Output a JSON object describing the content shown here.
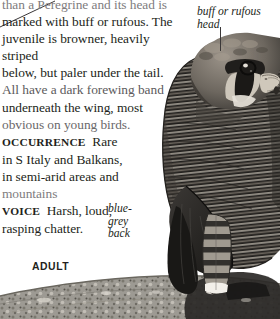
{
  "page": {
    "background_color": "#ffffff",
    "width": 280,
    "height": 319
  },
  "description": {
    "lines": [
      "than a Peregrine and its head is",
      "marked with buff or rufous. The",
      "juvenile is browner, heavily striped",
      "below, but paler under the tail.",
      "All have a dark forewing band",
      "underneath the wing, most",
      "obvious on young birds."
    ],
    "line1": "than a Peregrine and its head is",
    "line2": "marked with buff or rufous. The",
    "line3": "juvenile is browner, heavily striped",
    "line4": "below, but paler under the tail.",
    "line5": "All have a dark forewing band",
    "line6": "underneath the wing, most",
    "line7": "obvious on young birds."
  },
  "sections": [
    {
      "heading": "OCCURRENCE",
      "text": "Rare in S Italy and Balkans, in semi-arid areas and mountains"
    },
    {
      "heading": "VOICE",
      "text": "Harsh, loud, rasping chatter."
    }
  ],
  "occurrence": {
    "heading": "OCCURRENCE",
    "line1": "Rare",
    "line2": "in S Italy and Balkans,",
    "line3": "in semi-arid areas and",
    "line4": "mountains"
  },
  "voice": {
    "heading": "VOICE",
    "line1": "Harsh, loud,",
    "line2": "rasping chatter."
  },
  "annotations": [
    {
      "id": "head",
      "text": "buff or rufous\nhead",
      "style": "italic",
      "leader": "vertical"
    },
    {
      "id": "back",
      "text": "blue-\ngrey\nback",
      "style": "italic",
      "leader": "diagonal"
    }
  ],
  "annotation_head": "buff or rufous\nhead",
  "annotation_back": "blue-\ngrey\nback",
  "plate_label": "ADULT",
  "illustration": {
    "subject": "falcon-perched-on-rock",
    "description": "Adult falcon perched on a rocky outcrop, head turned to the right, showing barred blue-grey back, dark moustachial stripe, pale cheek and dark wings",
    "colors": {
      "plumage_dark": "#2e2b29",
      "plumage_mid": "#6f6a63",
      "plumage_light": "#b9b3aa",
      "head_buff": "#8d857a",
      "bill_pale": "#d8d2c8",
      "rock": "#9b9790",
      "rock_shadow": "#4a4744"
    }
  }
}
